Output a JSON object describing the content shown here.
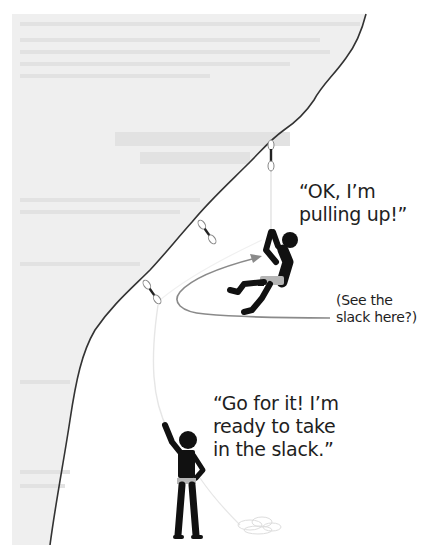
{
  "diagram": {
    "colors": {
      "rock_face": "#efefef",
      "rock_edge": "#333333",
      "figures": "#111111",
      "harness": "#b5b5b5",
      "slack_rope": "#8a8a8a",
      "rope": "#e6e6e6",
      "text": "#1e1e1e"
    },
    "climber": {
      "speech": "“OK, I’m\npulling up!”"
    },
    "belayer": {
      "speech": "“Go for it! I’m\nready to take\nin the slack.”"
    },
    "annotation": {
      "slack_note": "(See the\nslack here?)"
    },
    "quickdraws": [
      {
        "name": "quickdraw-top",
        "x": 271,
        "y": 145
      },
      {
        "name": "quickdraw-middle",
        "x": 207,
        "y": 232
      },
      {
        "name": "quickdraw-low",
        "x": 152,
        "y": 292
      }
    ]
  }
}
